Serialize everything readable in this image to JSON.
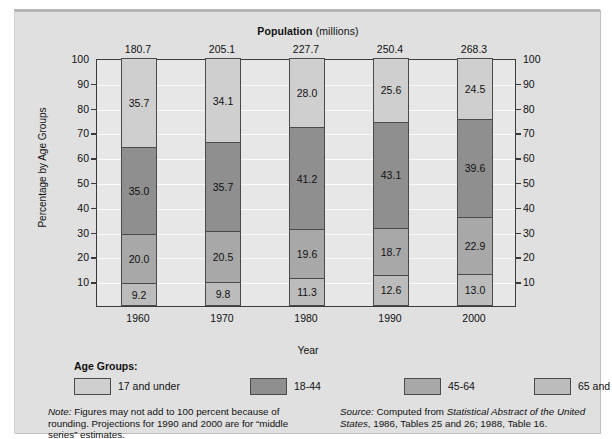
{
  "chart_data": {
    "type": "bar",
    "subtype": "stacked-100-percent-column",
    "title": "Population (millions)",
    "title_strong": "Population",
    "title_unit": "(millions)",
    "xlabel": "Year",
    "ylabel": "Percentage by Age Groups",
    "categories": [
      "1960",
      "1970",
      "1980",
      "1990",
      "2000"
    ],
    "top_axis_label": "Population (millions)",
    "top_axis_values": [
      "180.7",
      "205.1",
      "227.7",
      "250.4",
      "268.3"
    ],
    "ylim": [
      0,
      100
    ],
    "yticks": [
      "100",
      "90",
      "80",
      "70",
      "60",
      "50",
      "40",
      "30",
      "20",
      "10"
    ],
    "ytick_values": [
      100,
      90,
      80,
      70,
      60,
      50,
      40,
      30,
      20,
      10
    ],
    "grid": true,
    "grid_color": "#fbfbfb",
    "dual_y_axis": true,
    "legend_position": "bottom",
    "legend_title": "Age Groups:",
    "series": [
      {
        "name": "17 and under",
        "color": "#cfcfcf",
        "values": [
          35.7,
          34.1,
          28.0,
          25.6,
          24.5
        ],
        "labels": [
          "35.7",
          "34.1",
          "28.0",
          "25.6",
          "24.5"
        ]
      },
      {
        "name": "18-44",
        "color": "#8f8f8f",
        "values": [
          35.0,
          35.7,
          41.2,
          43.1,
          39.6
        ],
        "labels": [
          "35.0",
          "35.7",
          "41.2",
          "43.1",
          "39.6"
        ]
      },
      {
        "name": "45-64",
        "color": "#a8a8a8",
        "values": [
          20.0,
          20.5,
          19.6,
          18.7,
          22.9
        ],
        "labels": [
          "20.0",
          "20.5",
          "19.6",
          "18.7",
          "22.9"
        ]
      },
      {
        "name": "65 and over",
        "color": "#bcbcbc",
        "values": [
          9.2,
          9.8,
          11.3,
          12.6,
          13.0
        ],
        "labels": [
          "9.2",
          "9.8",
          "11.3",
          "12.6",
          "13.0"
        ]
      }
    ],
    "stack_order_bottom_to_top": [
      "65 and over",
      "45-64",
      "18-44",
      "17 and under"
    ]
  },
  "footnotes": {
    "note_label": "Note:",
    "note_text": " Figures may not add to 100 percent because of rounding. Projections for 1990 and 2000 are for “middle series” estimates.",
    "source_label": "Source:",
    "source_text_1": " Computed from ",
    "source_italic_1": "Statistical Abstract of the United States",
    "source_text_2": ", 1986, Tables 25 and 26; 1988, Table 16."
  },
  "colors": {
    "background": "#e0e0e0",
    "plot_background": "#e7e7e7",
    "frame": "#3a3a3a",
    "segment_border": "#4a4a4a",
    "text": "#111111"
  }
}
